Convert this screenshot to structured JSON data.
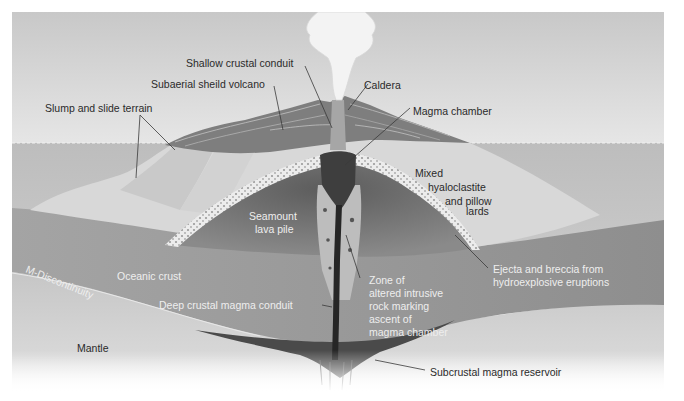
{
  "diagram": {
    "labels": {
      "shallow_crustal_conduit": "Shallow crustal conduit",
      "subaerial_shield_volcano": "Subaerial sheild volcano",
      "caldera": "Caldera",
      "slump_and_slide_terrain": "Slump and slide terrain",
      "magma_chamber": "Magma chamber",
      "mixed_hyaloclastite": [
        "Mixed",
        "hyaloclastite",
        "and pillow",
        "lards"
      ],
      "seamount_lava_pile": [
        "Seamount",
        "lava pile"
      ],
      "m_discontinuity": "M-Discontinuity",
      "oceanic_crust": "Oceanic crust",
      "deep_crustal_magma_conduit": "Deep crustal magma conduit",
      "zone_of_altered_rock": [
        "Zone of",
        "altered intrusive",
        "rock marking",
        "ascent of",
        "magma chamber"
      ],
      "ejecta_and_breccia": [
        "Ejecta and breccia from",
        "hydroexplosive eruptions"
      ],
      "mantle": "Mantle",
      "subcrustal_magma_reservoir": "Subcrustal magma reservoir"
    },
    "colors": {
      "sky": "#d4d4d4",
      "ocean": "#c2c2c2",
      "seamount_flank": "#dcdcdc",
      "lava_pile": "#7d7d7d",
      "oceanic_crust": "#9a9a9a",
      "mantle": "#cfcfcf",
      "conduit": "#2e2e2e",
      "plume": "#f4f4f4"
    }
  }
}
